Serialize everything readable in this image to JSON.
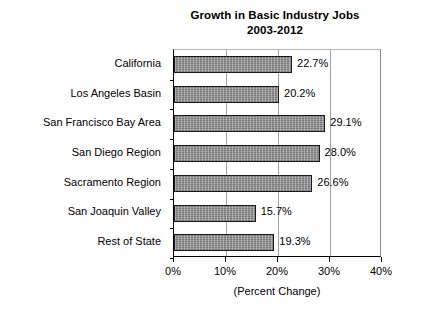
{
  "chart_data": {
    "type": "bar",
    "orientation": "horizontal",
    "title": "Growth in Basic Industry Jobs",
    "subtitle": "2003-2012",
    "xlabel": "(Percent Change)",
    "ylabel": "",
    "xlim": [
      0,
      40
    ],
    "xticks": [
      "0%",
      "10%",
      "20%",
      "30%",
      "40%"
    ],
    "xtick_values": [
      0,
      10,
      20,
      30,
      40
    ],
    "grid": "vertical",
    "legend": "none",
    "categories": [
      "California",
      "Los Angeles Basin",
      "San Francisco Bay Area",
      "San Diego Region",
      "Sacramento Region",
      "San Joaquin Valley",
      "Rest of State"
    ],
    "values": [
      22.7,
      20.2,
      29.1,
      28.0,
      26.6,
      15.7,
      19.3
    ],
    "data_labels": [
      "22.7%",
      "20.2%",
      "29.1%",
      "28.0%",
      "26.6%",
      "15.7%",
      "19.3%"
    ],
    "bar_fill_color": "#8a8a8a",
    "bar_border_color": "#1a1a1a",
    "axis_color": "#000000",
    "grid_color": "#a0a0a0",
    "background_color": "#ffffff"
  }
}
